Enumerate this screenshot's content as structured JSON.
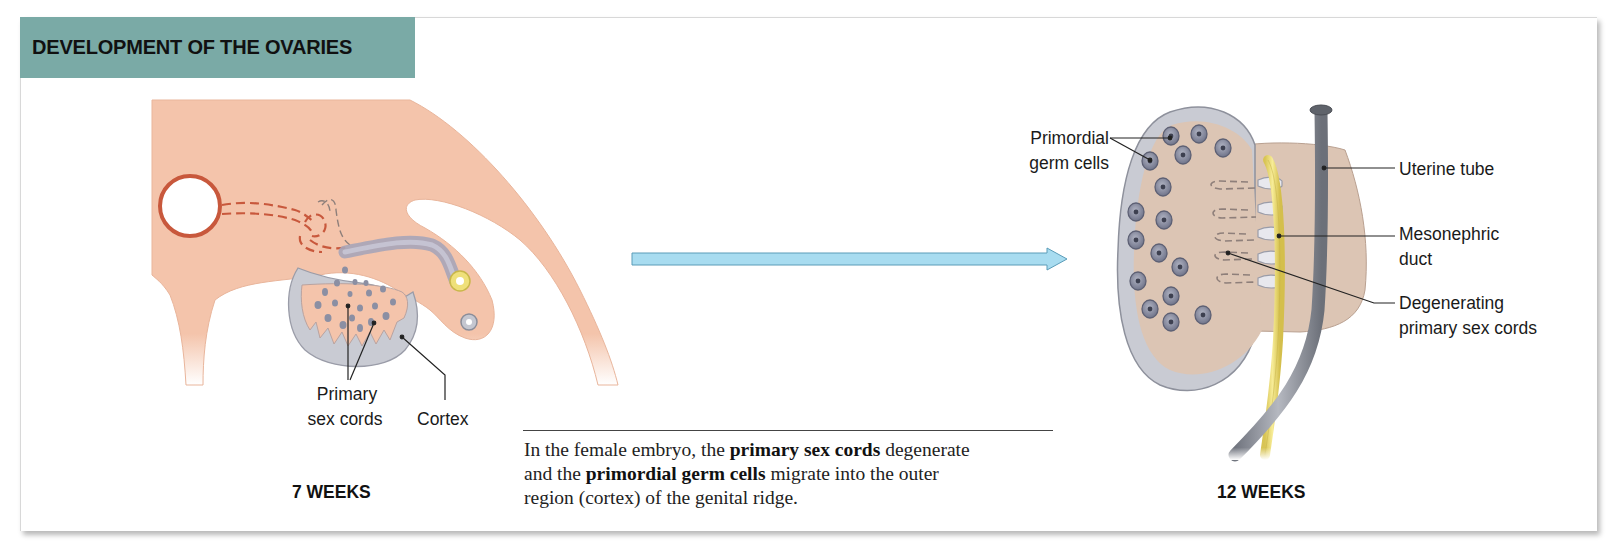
{
  "figure": {
    "title": "DEVELOPMENT OF THE OVARIES",
    "colors": {
      "title_bar": "#7aaaa6",
      "embryo_tissue": "#f4c4ab",
      "gonad_gray": "#c9cbd3",
      "germ_cell": "#7d8194",
      "duct_yellow": "#efe07a",
      "tube_gray": "#8f939c",
      "arrow_blue": "#a8dcf0",
      "vessel_red": "#c8583c"
    }
  },
  "left_panel": {
    "stage_label": "7 WEEKS",
    "labels": {
      "primary_sex_cords_line1": "Primary",
      "primary_sex_cords_line2": "sex cords",
      "cortex": "Cortex"
    }
  },
  "transition_arrow": {
    "direction": "right"
  },
  "caption": {
    "segments": [
      {
        "text": "In the female embryo, the ",
        "bold": false
      },
      {
        "text": "primary sex cords",
        "bold": true
      },
      {
        "text": " degenerate and the ",
        "bold": false
      },
      {
        "text": "primordial germ cells",
        "bold": true
      },
      {
        "text": " migrate into the outer region (cortex) of the genital ridge.",
        "bold": false
      }
    ],
    "s0": "In the female embryo, the ",
    "s1": "primary sex cords",
    "s2": " degenerate",
    "s3": "and the ",
    "s4": "primordial germ cells",
    "s5": " migrate into the outer",
    "s6": "region (cortex) of the genital ridge."
  },
  "right_panel": {
    "stage_label": "12 WEEKS",
    "labels": {
      "primordial_germ_cells_line1": "Primordial",
      "primordial_germ_cells_line2": "germ cells",
      "uterine_tube": "Uterine tube",
      "mesonephric_duct_line1": "Mesonephric",
      "mesonephric_duct_line2": "duct",
      "degenerating_cords_line1": "Degenerating",
      "degenerating_cords_line2": "primary sex cords"
    }
  }
}
